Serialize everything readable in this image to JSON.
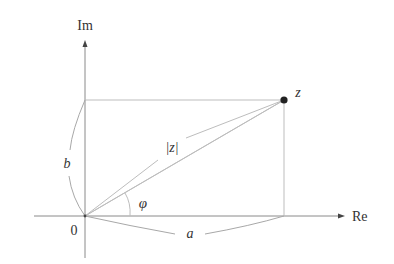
{
  "diagram": {
    "axes": {
      "real_label": "Re",
      "imag_label": "Im",
      "origin_label": "0"
    },
    "point": {
      "label": "z",
      "color": "#222222"
    },
    "labels": {
      "modulus": "|z|",
      "angle": "φ",
      "real_part": "a",
      "imag_part": "b"
    },
    "colors": {
      "axis": "#8a8a8a",
      "guide": "#bdbdbd",
      "text": "#333333"
    }
  }
}
